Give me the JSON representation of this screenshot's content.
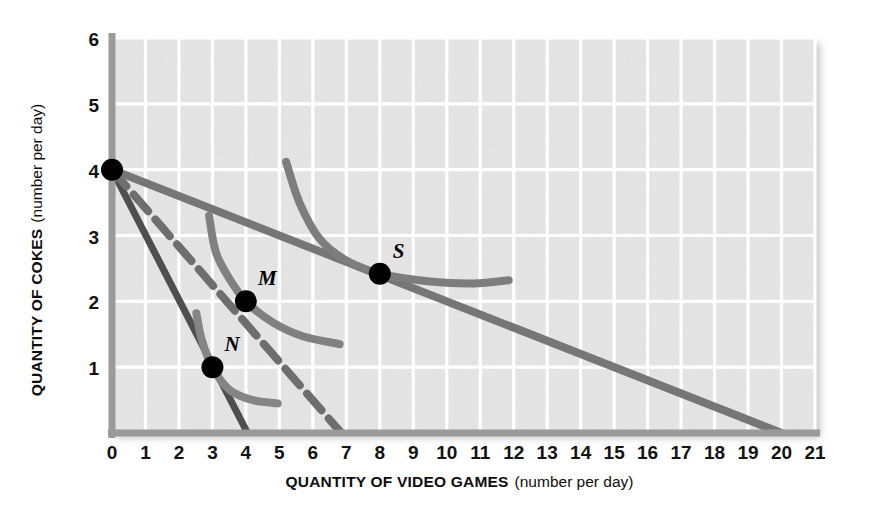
{
  "chart_data": {
    "type": "line",
    "title": "",
    "xlabel": "QUANTITY OF VIDEO GAMES",
    "xlabel_sub": "(number per day)",
    "ylabel": "QUANTITY OF COKES",
    "ylabel_sub": "(number per day)",
    "xlim": [
      0,
      21
    ],
    "ylim": [
      0,
      6
    ],
    "xticks": [
      "0",
      "1",
      "2",
      "3",
      "4",
      "5",
      "6",
      "7",
      "8",
      "9",
      "10",
      "11",
      "12",
      "13",
      "14",
      "15",
      "16",
      "17",
      "18",
      "19",
      "20",
      "21"
    ],
    "yticks": [
      "0",
      "1",
      "2",
      "3",
      "4",
      "5",
      "6"
    ],
    "grid": true,
    "legend": "none",
    "plot_bg": "#e6e6e6",
    "grid_color": "#ffffff",
    "axis_color": "#8c8c8c",
    "series": [
      {
        "name": "budget-line-steep",
        "kind": "budget-line",
        "style": "solid",
        "color": "#4f4f4f",
        "width": 7,
        "points": [
          [
            0,
            4
          ],
          [
            4.05,
            0
          ]
        ],
        "intercepts": {
          "y": 4,
          "x": 4
        }
      },
      {
        "name": "budget-line-middle",
        "kind": "budget-line",
        "style": "dashed",
        "color": "#6e6e6e",
        "width": 8,
        "dash": "22 11",
        "points": [
          [
            0,
            4
          ],
          [
            6.85,
            0
          ]
        ],
        "intercepts": {
          "y": 4,
          "x": 6.85
        }
      },
      {
        "name": "budget-line-flat",
        "kind": "budget-line",
        "style": "solid",
        "color": "#767676",
        "width": 8,
        "points": [
          [
            0,
            4
          ],
          [
            20,
            0
          ]
        ],
        "intercepts": {
          "y": 4,
          "x": 20
        }
      },
      {
        "name": "indifference-curve-N",
        "kind": "indifference-curve",
        "style": "solid",
        "color": "#858585",
        "width": 8,
        "through_point": "N",
        "points": [
          [
            2.52,
            1.82
          ],
          [
            2.68,
            1.42
          ],
          [
            3.0,
            1.0
          ],
          [
            3.5,
            0.66
          ],
          [
            4.2,
            0.5
          ],
          [
            4.95,
            0.45
          ]
        ]
      },
      {
        "name": "indifference-curve-M",
        "kind": "indifference-curve",
        "style": "solid",
        "color": "#808080",
        "width": 8,
        "through_point": "M",
        "points": [
          [
            2.9,
            3.3
          ],
          [
            3.1,
            2.75
          ],
          [
            3.5,
            2.35
          ],
          [
            4.0,
            2.0
          ],
          [
            4.8,
            1.68
          ],
          [
            5.7,
            1.47
          ],
          [
            6.8,
            1.35
          ]
        ]
      },
      {
        "name": "indifference-curve-S",
        "kind": "indifference-curve",
        "style": "solid",
        "color": "#7d7d7d",
        "width": 8,
        "through_point": "S",
        "points": [
          [
            5.2,
            4.12
          ],
          [
            5.6,
            3.5
          ],
          [
            6.2,
            2.95
          ],
          [
            7.0,
            2.62
          ],
          [
            8.0,
            2.42
          ],
          [
            9.5,
            2.3
          ],
          [
            10.8,
            2.27
          ],
          [
            11.85,
            2.32
          ]
        ]
      }
    ],
    "points": [
      {
        "label": "",
        "name": "origin-bundle-point",
        "x": 0,
        "y": 4,
        "r": 11,
        "color": "#000000",
        "label_dx": 0,
        "label_dy": 0
      },
      {
        "label": "N",
        "name": "point-N",
        "x": 3,
        "y": 1,
        "r": 11,
        "color": "#000000",
        "label_dx": 12,
        "label_dy": -16
      },
      {
        "label": "M",
        "name": "point-M",
        "x": 4,
        "y": 2,
        "r": 11,
        "color": "#000000",
        "label_dx": 12,
        "label_dy": -16
      },
      {
        "label": "S",
        "name": "point-S",
        "x": 8,
        "y": 2.42,
        "r": 11,
        "color": "#000000",
        "label_dx": 13,
        "label_dy": -16
      }
    ]
  }
}
